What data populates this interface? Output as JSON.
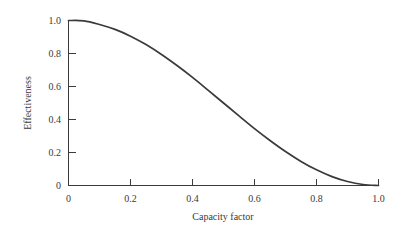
{
  "chart_data": {
    "type": "line",
    "title": "",
    "subtitle": "",
    "xlabel": "Capacity factor",
    "ylabel": "Effectiveness",
    "xlim": [
      0,
      1.0
    ],
    "ylim": [
      0,
      1.0
    ],
    "grid": false,
    "legend": false,
    "legend_position": "none",
    "line_color": "#3a3a3a",
    "background_color": "#ffffff",
    "axis_color": "#3b3b3b",
    "x_ticks": [
      0,
      0.2,
      0.4,
      0.6,
      0.8,
      1.0
    ],
    "x_tick_labels": [
      "0",
      "0.2",
      "0.4",
      "0.6",
      "0.8",
      "1.0"
    ],
    "y_ticks": [
      0,
      0.2,
      0.4,
      0.6,
      0.8,
      1.0
    ],
    "y_tick_labels": [
      "0",
      "0.2",
      "0.4",
      "0.6",
      "0.8",
      "1.0"
    ],
    "tick_direction": "in",
    "series": [
      {
        "name": "Effectiveness",
        "x": [
          0.0,
          0.05,
          0.1,
          0.15,
          0.2,
          0.25,
          0.3,
          0.35,
          0.4,
          0.45,
          0.5,
          0.55,
          0.6,
          0.65,
          0.7,
          0.75,
          0.8,
          0.85,
          0.9,
          0.95,
          1.0
        ],
        "values": [
          1.0,
          0.998,
          0.976,
          0.946,
          0.905,
          0.854,
          0.794,
          0.727,
          0.655,
          0.578,
          0.5,
          0.422,
          0.345,
          0.273,
          0.206,
          0.146,
          0.095,
          0.054,
          0.024,
          0.006,
          0.0
        ]
      }
    ]
  },
  "axes": {
    "x_title": "Capacity factor",
    "y_title": "Effectiveness",
    "x_tick_labels": [
      "0",
      "0.2",
      "0.4",
      "0.6",
      "0.8",
      "1.0"
    ],
    "y_tick_labels": [
      "1.0",
      "0.8",
      "0.6",
      "0.4",
      "0.2",
      "0"
    ]
  }
}
